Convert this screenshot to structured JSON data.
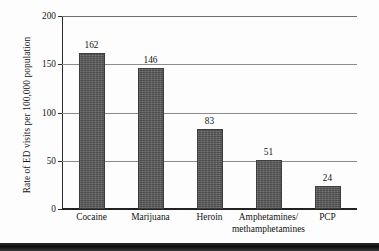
{
  "chart_data": {
    "type": "bar",
    "title": "",
    "xlabel": "",
    "ylabel": "Rate of ED visits per 100,000 population",
    "categories": [
      "Cocaine",
      "Marijuana",
      "Heroin",
      "Amphetamines/ methamphetamines",
      "PCP"
    ],
    "category_lines": [
      [
        "Cocaine"
      ],
      [
        "Marijuana"
      ],
      [
        "Heroin"
      ],
      [
        "Amphetamines/",
        "methamphetamines"
      ],
      [
        "PCP"
      ]
    ],
    "values": [
      162,
      146,
      83,
      51,
      24
    ],
    "value_labels": [
      "162",
      "146",
      "83",
      "51",
      "24"
    ],
    "ylim": [
      0,
      200
    ],
    "yticks": [
      0,
      50,
      100,
      150,
      200
    ],
    "ytick_labels": [
      "0",
      "50",
      "100",
      "150",
      "200"
    ],
    "grid": true,
    "legend": "none",
    "bar_color": "#59595a",
    "axis_color": "#222222",
    "grid_color": "#8c8c8c",
    "text_color": "#141414"
  }
}
